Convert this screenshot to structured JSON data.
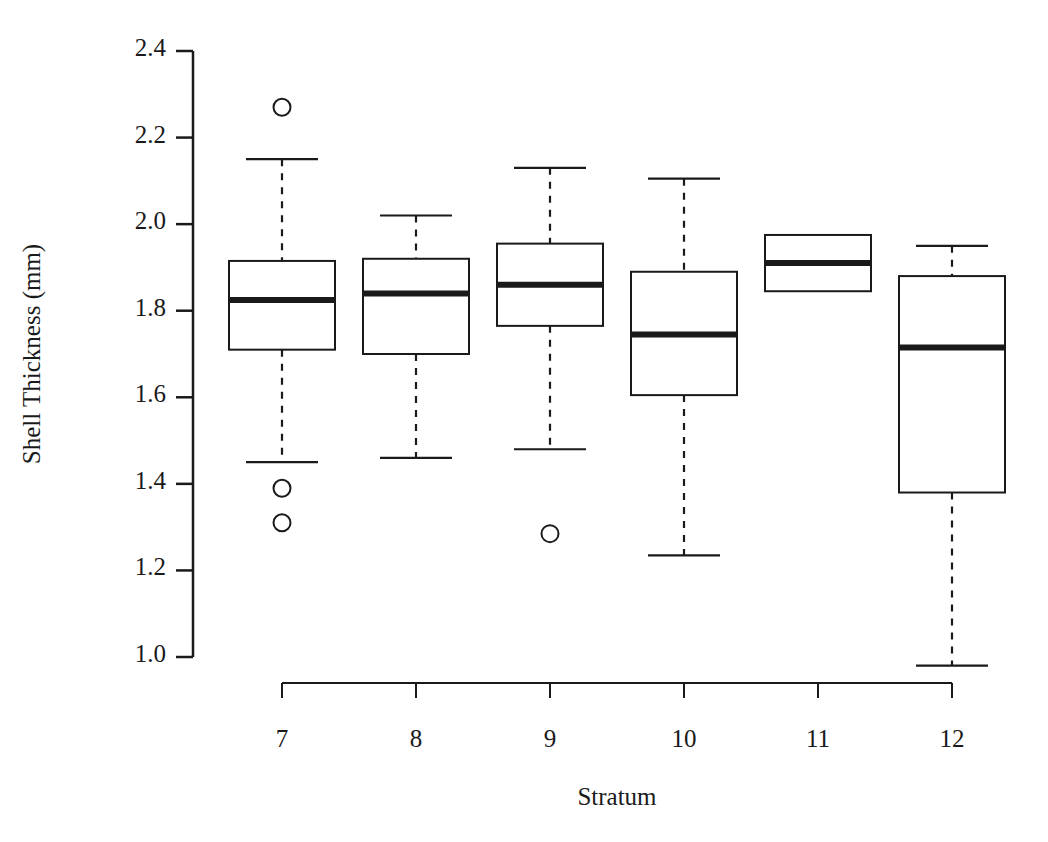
{
  "chart_data": {
    "type": "box",
    "title": "",
    "xlabel": "Stratum",
    "ylabel": "Shell Thickness (mm)",
    "categories": [
      "7",
      "8",
      "9",
      "10",
      "11",
      "12"
    ],
    "ylim": [
      1.0,
      2.4
    ],
    "yticks": [
      "1.0",
      "1.2",
      "1.4",
      "1.6",
      "1.8",
      "2.0",
      "2.2",
      "2.4"
    ],
    "ytick_values": [
      1.0,
      1.2,
      1.4,
      1.6,
      1.8,
      2.0,
      2.2,
      2.4
    ],
    "grid": false,
    "legend": null,
    "boxes": [
      {
        "category": "7",
        "whisker_low": 1.45,
        "q1": 1.71,
        "median": 1.825,
        "q3": 1.915,
        "whisker_high": 2.15,
        "outliers": [
          2.27,
          1.39,
          1.31
        ]
      },
      {
        "category": "8",
        "whisker_low": 1.46,
        "q1": 1.7,
        "median": 1.84,
        "q3": 1.92,
        "whisker_high": 2.02,
        "outliers": []
      },
      {
        "category": "9",
        "whisker_low": 1.48,
        "q1": 1.765,
        "median": 1.86,
        "q3": 1.955,
        "whisker_high": 2.13,
        "outliers": [
          1.285
        ]
      },
      {
        "category": "10",
        "whisker_low": 1.235,
        "q1": 1.605,
        "median": 1.745,
        "q3": 1.89,
        "whisker_high": 2.105,
        "outliers": []
      },
      {
        "category": "11",
        "whisker_low": 1.845,
        "q1": 1.845,
        "median": 1.91,
        "q3": 1.975,
        "whisker_high": 1.975,
        "outliers": []
      },
      {
        "category": "12",
        "whisker_low": 0.98,
        "q1": 1.38,
        "median": 1.715,
        "q3": 1.88,
        "whisker_high": 1.95,
        "outliers": []
      }
    ],
    "colors": {
      "line": "#1a1a1a",
      "box_fill": "#ffffff",
      "median": "#000000",
      "outlier_stroke": "#1a1a1a"
    }
  }
}
